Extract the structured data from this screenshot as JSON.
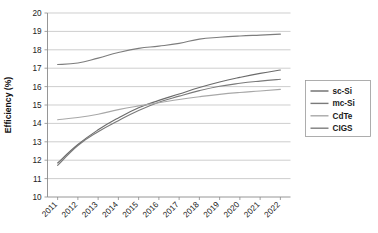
{
  "chart_data": {
    "type": "line",
    "title": "",
    "xlabel": "",
    "ylabel": "Efficiency (%)",
    "categories": [
      "2011",
      "2012",
      "2013",
      "2014",
      "2015",
      "2016",
      "2017",
      "2018",
      "2019",
      "2020",
      "2021",
      "2022"
    ],
    "ylim": [
      10,
      20
    ],
    "ytick_labels": [
      "10",
      "11",
      "12",
      "13",
      "14",
      "15",
      "16",
      "17",
      "18",
      "19",
      "20"
    ],
    "ytick_values": [
      10,
      11,
      12,
      13,
      14,
      15,
      16,
      17,
      18,
      19,
      20
    ],
    "grid": true,
    "legend_position": "right",
    "series": [
      {
        "name": "sc-Si",
        "color": "#6b6b6b",
        "values": [
          11.85,
          12.85,
          13.65,
          14.3,
          14.85,
          15.25,
          15.6,
          15.95,
          16.25,
          16.5,
          16.72,
          16.9
        ]
      },
      {
        "name": "mc-Si",
        "color": "#7a7a7a",
        "values": [
          11.72,
          12.8,
          13.55,
          14.15,
          14.7,
          15.15,
          15.48,
          15.78,
          16.02,
          16.18,
          16.3,
          16.4
        ]
      },
      {
        "name": "CdTe",
        "color": "#a8a8a8",
        "values": [
          14.2,
          14.32,
          14.5,
          14.75,
          14.95,
          15.12,
          15.3,
          15.45,
          15.58,
          15.68,
          15.76,
          15.85
        ]
      },
      {
        "name": "CIGS",
        "color": "#7d7d7d",
        "values": [
          17.2,
          17.28,
          17.55,
          17.85,
          18.08,
          18.2,
          18.35,
          18.58,
          18.68,
          18.75,
          18.8,
          18.85
        ]
      }
    ]
  },
  "legend": {
    "entries": [
      {
        "label": "sc-Si"
      },
      {
        "label": "mc-Si"
      },
      {
        "label": "CdTe"
      },
      {
        "label": "CIGS"
      }
    ]
  }
}
